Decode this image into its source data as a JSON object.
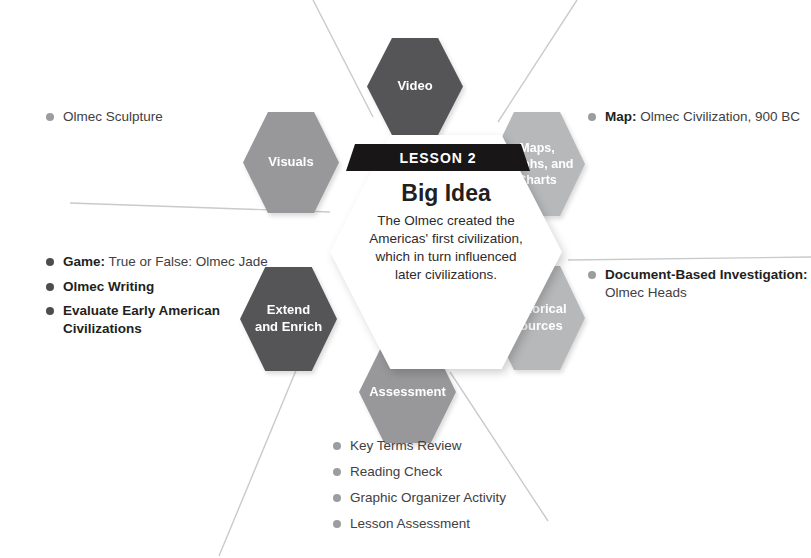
{
  "center": {
    "badge": "LESSON 2",
    "title": "Big Idea",
    "lines": [
      "The Olmec created the",
      "Americas' first civilization,",
      "which in turn influenced",
      "later civilizations."
    ]
  },
  "hexes": {
    "video": {
      "label": "Video"
    },
    "visuals": {
      "label": "Visuals"
    },
    "maps": {
      "line1": "Maps,",
      "line2": "Graphs, and",
      "line3": "Charts"
    },
    "extend": {
      "line1": "Extend",
      "line2": "and Enrich"
    },
    "historical": {
      "line1": "Historical",
      "line2": "Sources"
    },
    "assessment": {
      "label": "Assessment"
    }
  },
  "callouts": {
    "visuals": {
      "item1": "Olmec Sculpture"
    },
    "maps": {
      "item1_bold": "Map:",
      "item1_rest": " Olmec Civilization, 900 BC"
    },
    "historical": {
      "item1_bold": "Document-Based Investigation:",
      "item1_line2": "Olmec Heads"
    },
    "extend": {
      "item1_bold": "Game:",
      "item1_rest": " True or False: Olmec Jade",
      "item2": "Olmec Writing",
      "item3": "Evaluate Early American Civilizations"
    },
    "assessment": {
      "item1": "Key Terms Review",
      "item2": "Reading Check",
      "item3": "Graphic Organizer Activity",
      "item4": "Lesson Assessment"
    }
  },
  "colors": {
    "dark_hex": "#555457",
    "mid_hex": "#98989b",
    "light_hex": "#b7b8ba",
    "banner": "#191617",
    "leader_line": "#c9cacc"
  }
}
